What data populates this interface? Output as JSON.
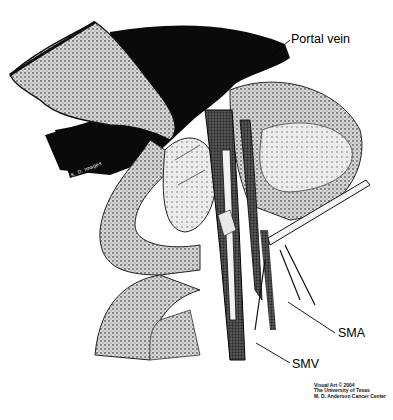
{
  "figure": {
    "type": "anatomical illustration",
    "style": "stippled black-and-white halftone",
    "colors": {
      "ink": "#000000",
      "tone": "#8c8c8c",
      "light": "#d8d8d8",
      "background": "#ffffff"
    }
  },
  "labels": {
    "portal_vein": "Portal vein",
    "sma": "SMA",
    "smv": "SMV"
  },
  "signature": "K. D. Images",
  "credit": {
    "line1": "Visual Art © 2004",
    "line2": "The University of Texas",
    "line3": "M. D. Anderson Cancer Center"
  }
}
